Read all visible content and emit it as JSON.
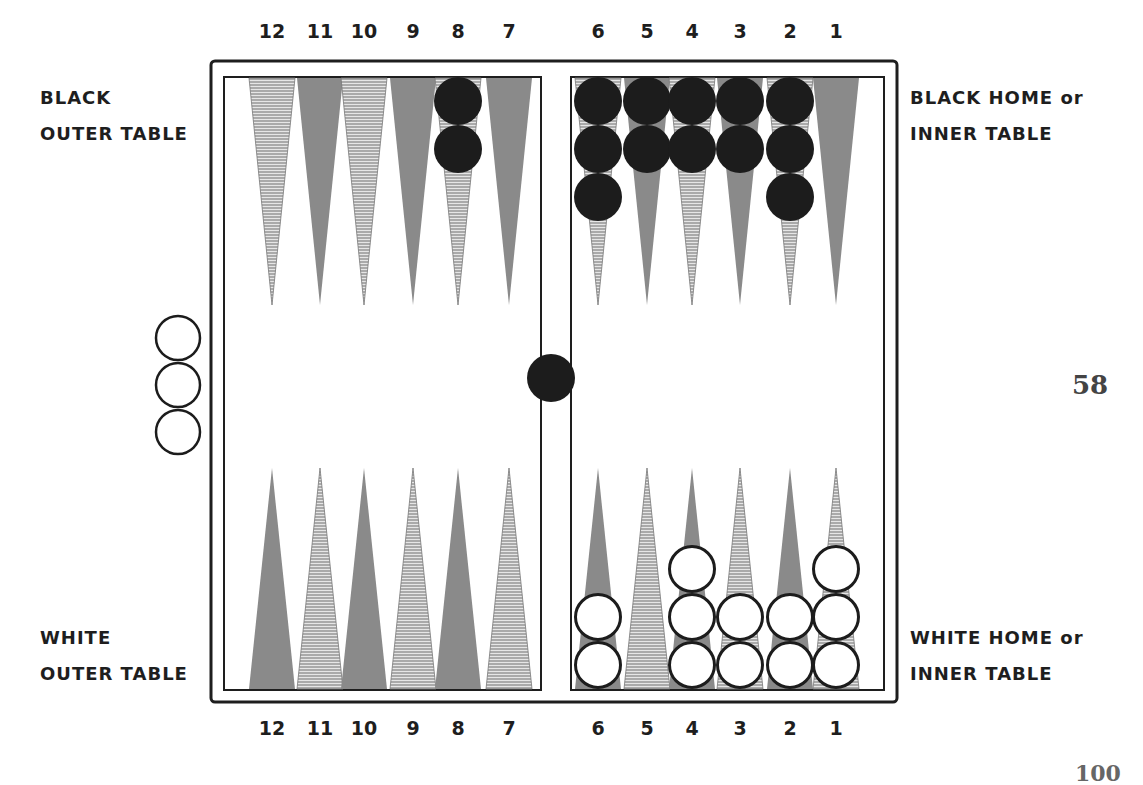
{
  "labels": {
    "black_outer": [
      "BLACK",
      "OUTER TABLE"
    ],
    "black_home": [
      "BLACK HOME or",
      "INNER TABLE"
    ],
    "white_outer": [
      "WHITE",
      "OUTER TABLE"
    ],
    "white_home": [
      "WHITE HOME or",
      "INNER TABLE"
    ]
  },
  "page_number": "58",
  "bottom_page_fragment": "100",
  "point_numbers_top": [
    "12",
    "11",
    "10",
    "9",
    "8",
    "7",
    "6",
    "5",
    "4",
    "3",
    "2",
    "1"
  ],
  "point_numbers_bottom": [
    "12",
    "11",
    "10",
    "9",
    "8",
    "7",
    "6",
    "5",
    "4",
    "3",
    "2",
    "1"
  ],
  "colors": {
    "frame": "#1e1e1e",
    "point_solid": "#8a8a8a",
    "point_hatch_line": "#6e6e6e",
    "black_checker": "#1c1c1c",
    "white_checker_fill": "#ffffff",
    "white_checker_stroke": "#1c1c1c"
  },
  "board": {
    "frame": {
      "x": 211,
      "y": 61,
      "w": 686,
      "h": 641
    },
    "left_table": {
      "x": 224,
      "y": 77,
      "w": 317,
      "h": 613
    },
    "right_table": {
      "x": 571,
      "y": 77,
      "w": 313,
      "h": 613
    },
    "point_x": {
      "12": 272,
      "11": 320,
      "10": 364,
      "9": 413,
      "8": 458,
      "7": 509,
      "6": 598,
      "5": 647,
      "4": 692,
      "3": 740,
      "2": 790,
      "1": 836
    },
    "top_points": [
      {
        "point": "12",
        "style": "hatch"
      },
      {
        "point": "11",
        "style": "solid"
      },
      {
        "point": "10",
        "style": "hatch"
      },
      {
        "point": "9",
        "style": "solid"
      },
      {
        "point": "8",
        "style": "hatch"
      },
      {
        "point": "7",
        "style": "solid"
      },
      {
        "point": "6",
        "style": "hatch"
      },
      {
        "point": "5",
        "style": "solid"
      },
      {
        "point": "4",
        "style": "hatch"
      },
      {
        "point": "3",
        "style": "solid"
      },
      {
        "point": "2",
        "style": "hatch"
      },
      {
        "point": "1",
        "style": "solid"
      }
    ],
    "bottom_points": [
      {
        "point": "12",
        "style": "solid"
      },
      {
        "point": "11",
        "style": "hatch"
      },
      {
        "point": "10",
        "style": "solid"
      },
      {
        "point": "9",
        "style": "hatch"
      },
      {
        "point": "8",
        "style": "solid"
      },
      {
        "point": "7",
        "style": "hatch"
      },
      {
        "point": "6",
        "style": "solid"
      },
      {
        "point": "5",
        "style": "hatch"
      },
      {
        "point": "4",
        "style": "solid"
      },
      {
        "point": "3",
        "style": "hatch"
      },
      {
        "point": "2",
        "style": "solid"
      },
      {
        "point": "1",
        "style": "hatch"
      }
    ]
  },
  "checkers": {
    "black_top": [
      {
        "point": "8",
        "count": 2
      },
      {
        "point": "6",
        "count": 3
      },
      {
        "point": "5",
        "count": 2
      },
      {
        "point": "4",
        "count": 2
      },
      {
        "point": "3",
        "count": 2
      },
      {
        "point": "2",
        "count": 3
      }
    ],
    "white_bottom": [
      {
        "point": "6",
        "count": 2
      },
      {
        "point": "4",
        "count": 3
      },
      {
        "point": "3",
        "count": 2
      },
      {
        "point": "2",
        "count": 2
      },
      {
        "point": "1",
        "count": 3
      }
    ],
    "black_on_bar": 1,
    "white_off_board": 3
  }
}
